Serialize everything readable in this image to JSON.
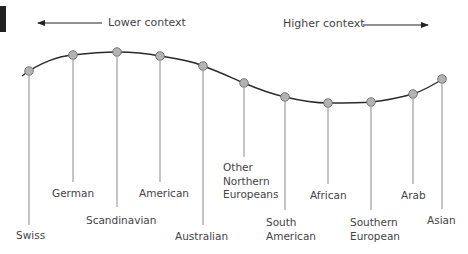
{
  "diagram": {
    "axis": {
      "left_label": "Lower context",
      "right_label": "Higher context"
    },
    "colors": {
      "curve": "#2a2a2a",
      "node_fill": "#b3b3b3",
      "node_stroke": "#6e6e6e",
      "stem": "#8a8a8a",
      "text": "#444444"
    },
    "nodes": [
      {
        "label": "Swiss",
        "x": 29,
        "y": 71,
        "stem_end": 225
      },
      {
        "label": "German",
        "x": 73,
        "y": 55,
        "stem_end": 182
      },
      {
        "label": "Scandinavian",
        "x": 117,
        "y": 52,
        "stem_end": 207
      },
      {
        "label": "American",
        "x": 160,
        "y": 56,
        "stem_end": 182
      },
      {
        "label": "Australian",
        "x": 203,
        "y": 66,
        "stem_end": 225
      },
      {
        "label": "Other\nNorthern\nEuropeans",
        "x": 244,
        "y": 83,
        "stem_end": 157
      },
      {
        "label": "South\nAmerican",
        "x": 285,
        "y": 97,
        "stem_end": 210
      },
      {
        "label": "African",
        "x": 328,
        "y": 103,
        "stem_end": 184
      },
      {
        "label": "Southern\nEuropean",
        "x": 371,
        "y": 102,
        "stem_end": 210
      },
      {
        "label": "Arab",
        "x": 413,
        "y": 94,
        "stem_end": 184
      },
      {
        "label": "Asian",
        "x": 442,
        "y": 79,
        "stem_end": 209
      }
    ]
  }
}
